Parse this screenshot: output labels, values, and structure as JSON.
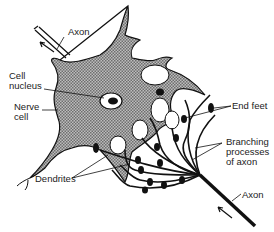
{
  "diagram": {
    "labels": {
      "axon_top": "Axon",
      "cell_nucleus_1": "Cell",
      "cell_nucleus_2": "nucleus",
      "nerve_cell_1": "Nerve",
      "nerve_cell_2": "cell",
      "end_feet": "End feet",
      "branching_1": "Branching",
      "branching_2": "processes",
      "branching_3": "of axon",
      "dendrites": "Dendrites",
      "axon_bottom": "Axon"
    },
    "colors": {
      "cell_fill": "#9a9a9a",
      "line": "#111111",
      "background": "#ffffff"
    }
  }
}
